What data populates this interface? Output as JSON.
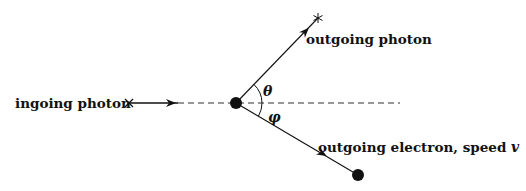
{
  "diagram": {
    "labels": {
      "ingoing": "ingoing photon",
      "outgoing_photon": "outgoing photon",
      "outgoing_electron": "outgoing electron, speed ",
      "electron_speed_symbol": "v",
      "theta": "θ",
      "phi": "φ"
    },
    "elements": {
      "scattering_point": {
        "x": 236,
        "y": 103
      },
      "incoming_start_cross": {
        "x": 129,
        "y": 103
      },
      "incoming_arrow_end": {
        "x": 178,
        "y": 103
      },
      "dashed_axis_end": {
        "x": 400,
        "y": 103
      },
      "photon_end_star": {
        "x": 318,
        "y": 18
      },
      "electron_end_dot": {
        "x": 358,
        "y": 175
      }
    },
    "colors": {
      "stroke": "#111111",
      "background": "#ffffff"
    }
  }
}
